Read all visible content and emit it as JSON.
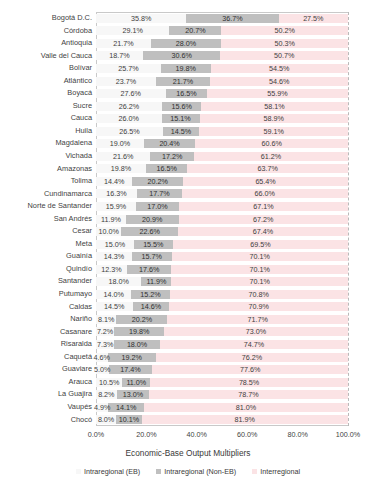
{
  "chart_data": {
    "type": "bar",
    "subtype": "stacked-horizontal-100%",
    "title": "",
    "xlabel": "Economic-Base Output Multipliers",
    "ylabel": "",
    "xlim": [
      0,
      100
    ],
    "xticks": [
      "0.0%",
      "20.0%",
      "40.0%",
      "60.0%",
      "80.0%",
      "100.0%"
    ],
    "xtick_values": [
      0,
      20,
      40,
      60,
      80,
      100
    ],
    "grid": false,
    "legend_position": "bottom",
    "legend": [
      {
        "label": "Intraregional (EB)",
        "color": "#f7f7f7",
        "swatch": "eb-swatch"
      },
      {
        "label": "Intraregional (Non-EB)",
        "color": "#bfbfbf",
        "swatch": "noneb-swatch"
      },
      {
        "label": "Interregional",
        "color": "#fbe3e5",
        "swatch": "inter-swatch"
      }
    ],
    "series": [
      {
        "name": "Intraregional (EB)",
        "key": "eb"
      },
      {
        "name": "Intraregional (Non-EB)",
        "key": "noneb"
      },
      {
        "name": "Interregional",
        "key": "inter"
      }
    ],
    "categories": [
      "Bogotá D.C.",
      "Córdoba",
      "Antioquia",
      "Valle del Cauca",
      "Bolívar",
      "Atlántico",
      "Boyacá",
      "Sucre",
      "Cauca",
      "Huila",
      "Magdalena",
      "Vichada",
      "Amazonas",
      "Tolima",
      "Cundinamarca",
      "Norte de Santander",
      "San Andrés",
      "Cesar",
      "Meta",
      "Guainía",
      "Quindío",
      "Santander",
      "Putumayo",
      "Caldas",
      "Nariño",
      "Casanare",
      "Risaralda",
      "Caquetá",
      "Guaviare",
      "Arauca",
      "La Guajira",
      "Vaupés",
      "Chocó"
    ],
    "rows": [
      {
        "category": "Bogotá D.C.",
        "eb": 35.8,
        "noneb": 36.7,
        "inter": 27.5,
        "eb_label": "35.8%",
        "noneb_label": "36.7%",
        "inter_label": "27.5%"
      },
      {
        "category": "Córdoba",
        "eb": 29.1,
        "noneb": 20.7,
        "inter": 50.2,
        "eb_label": "29.1%",
        "noneb_label": "20.7%",
        "inter_label": "50.2%"
      },
      {
        "category": "Antioquia",
        "eb": 21.7,
        "noneb": 28.0,
        "inter": 50.3,
        "eb_label": "21.7%",
        "noneb_label": "28.0%",
        "inter_label": "50.3%"
      },
      {
        "category": "Valle del Cauca",
        "eb": 18.7,
        "noneb": 30.6,
        "inter": 50.7,
        "eb_label": "18.7%",
        "noneb_label": "30.6%",
        "inter_label": "50.7%"
      },
      {
        "category": "Bolívar",
        "eb": 25.7,
        "noneb": 19.8,
        "inter": 54.5,
        "eb_label": "25.7%",
        "noneb_label": "19.8%",
        "inter_label": "54.5%"
      },
      {
        "category": "Atlántico",
        "eb": 23.7,
        "noneb": 21.7,
        "inter": 54.6,
        "eb_label": "23.7%",
        "noneb_label": "21.7%",
        "inter_label": "54.6%"
      },
      {
        "category": "Boyacá",
        "eb": 27.6,
        "noneb": 16.5,
        "inter": 55.9,
        "eb_label": "27.6%",
        "noneb_label": "16.5%",
        "inter_label": "55.9%"
      },
      {
        "category": "Sucre",
        "eb": 26.2,
        "noneb": 15.6,
        "inter": 58.1,
        "eb_label": "26.2%",
        "noneb_label": "15.6%",
        "inter_label": "58.1%"
      },
      {
        "category": "Cauca",
        "eb": 26.0,
        "noneb": 15.1,
        "inter": 58.9,
        "eb_label": "26.0%",
        "noneb_label": "15.1%",
        "inter_label": "58.9%"
      },
      {
        "category": "Huila",
        "eb": 26.5,
        "noneb": 14.5,
        "inter": 59.1,
        "eb_label": "26.5%",
        "noneb_label": "14.5%",
        "inter_label": "59.1%"
      },
      {
        "category": "Magdalena",
        "eb": 19.0,
        "noneb": 20.4,
        "inter": 60.6,
        "eb_label": "19.0%",
        "noneb_label": "20.4%",
        "inter_label": "60.6%"
      },
      {
        "category": "Vichada",
        "eb": 21.6,
        "noneb": 17.2,
        "inter": 61.2,
        "eb_label": "21.6%",
        "noneb_label": "17.2%",
        "inter_label": "61.2%"
      },
      {
        "category": "Amazonas",
        "eb": 19.8,
        "noneb": 16.5,
        "inter": 63.7,
        "eb_label": "19.8%",
        "noneb_label": "16.5%",
        "inter_label": "63.7%"
      },
      {
        "category": "Tolima",
        "eb": 14.4,
        "noneb": 20.2,
        "inter": 65.4,
        "eb_label": "14.4%",
        "noneb_label": "20.2%",
        "inter_label": "65.4%"
      },
      {
        "category": "Cundinamarca",
        "eb": 16.3,
        "noneb": 17.7,
        "inter": 66.0,
        "eb_label": "16.3%",
        "noneb_label": "17.7%",
        "inter_label": "66.0%"
      },
      {
        "category": "Norte de Santander",
        "eb": 15.9,
        "noneb": 17.0,
        "inter": 67.1,
        "eb_label": "15.9%",
        "noneb_label": "17.0%",
        "inter_label": "67.1%"
      },
      {
        "category": "San Andrés",
        "eb": 11.9,
        "noneb": 20.9,
        "inter": 67.2,
        "eb_label": "11.9%",
        "noneb_label": "20.9%",
        "inter_label": "67.2%"
      },
      {
        "category": "Cesar",
        "eb": 10.0,
        "noneb": 22.6,
        "inter": 67.4,
        "eb_label": "10.0%",
        "noneb_label": "22.6%",
        "inter_label": "67.4%"
      },
      {
        "category": "Meta",
        "eb": 15.0,
        "noneb": 15.5,
        "inter": 69.5,
        "eb_label": "15.0%",
        "noneb_label": "15.5%",
        "inter_label": "69.5%"
      },
      {
        "category": "Guainía",
        "eb": 14.3,
        "noneb": 15.7,
        "inter": 70.1,
        "eb_label": "14.3%",
        "noneb_label": "15.7%",
        "inter_label": "70.1%"
      },
      {
        "category": "Quindío",
        "eb": 12.3,
        "noneb": 17.6,
        "inter": 70.1,
        "eb_label": "12.3%",
        "noneb_label": "17.6%",
        "inter_label": "70.1%"
      },
      {
        "category": "Santander",
        "eb": 18.0,
        "noneb": 11.9,
        "inter": 70.1,
        "eb_label": "18.0%",
        "noneb_label": "11.9%",
        "inter_label": "70.1%"
      },
      {
        "category": "Putumayo",
        "eb": 14.0,
        "noneb": 15.2,
        "inter": 70.8,
        "eb_label": "14.0%",
        "noneb_label": "15.2%",
        "inter_label": "70.8%"
      },
      {
        "category": "Caldas",
        "eb": 14.5,
        "noneb": 14.6,
        "inter": 70.9,
        "eb_label": "14.5%",
        "noneb_label": "14.6%",
        "inter_label": "70.9%"
      },
      {
        "category": "Nariño",
        "eb": 8.1,
        "noneb": 20.2,
        "inter": 71.7,
        "eb_label": "8.1%",
        "noneb_label": "20.2%",
        "inter_label": "71.7%"
      },
      {
        "category": "Casanare",
        "eb": 7.2,
        "noneb": 19.8,
        "inter": 73.0,
        "eb_label": "7.2%",
        "noneb_label": "19.8%",
        "inter_label": "73.0%"
      },
      {
        "category": "Risaralda",
        "eb": 7.3,
        "noneb": 18.0,
        "inter": 74.7,
        "eb_label": "7.3%",
        "noneb_label": "18.0%",
        "inter_label": "74.7%"
      },
      {
        "category": "Caquetá",
        "eb": 4.6,
        "noneb": 19.2,
        "inter": 76.2,
        "eb_label": "4.6%",
        "noneb_label": "19.2%",
        "inter_label": "76.2%"
      },
      {
        "category": "Guaviare",
        "eb": 5.0,
        "noneb": 17.4,
        "inter": 77.6,
        "eb_label": "5.0%",
        "noneb_label": "17.4%",
        "inter_label": "77.6%"
      },
      {
        "category": "Arauca",
        "eb": 10.5,
        "noneb": 11.0,
        "inter": 78.5,
        "eb_label": "10.5%",
        "noneb_label": "11.0%",
        "inter_label": "78.5%"
      },
      {
        "category": "La Guajira",
        "eb": 8.2,
        "noneb": 13.0,
        "inter": 78.7,
        "eb_label": "8.2%",
        "noneb_label": "13.0%",
        "inter_label": "78.7%"
      },
      {
        "category": "Vaupés",
        "eb": 4.9,
        "noneb": 14.1,
        "inter": 81.0,
        "eb_label": "4.9%",
        "noneb_label": "14.1%",
        "inter_label": "81.0%"
      },
      {
        "category": "Chocó",
        "eb": 8.0,
        "noneb": 10.1,
        "inter": 81.9,
        "eb_label": "8.0%",
        "noneb_label": "10.1%",
        "inter_label": "81.9%"
      }
    ],
    "colors": {
      "eb": "#f7f7f7",
      "noneb": "#bfbfbf",
      "inter": "#fbe3e5",
      "plot_border": "#c9c9c9",
      "text": "#3b3b3b"
    }
  }
}
